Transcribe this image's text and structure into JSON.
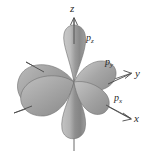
{
  "figure": {
    "kind": "atomic-orbital-diagram",
    "title": "",
    "background_color": "#ffffff"
  },
  "axes": [
    {
      "key": "z",
      "label": "z",
      "direction": "up",
      "arrow": true
    },
    {
      "key": "y",
      "label": "y",
      "direction": "upper-right",
      "arrow": true
    },
    {
      "key": "x",
      "label": "x",
      "direction": "lower-right",
      "arrow": true
    }
  ],
  "orbitals": [
    {
      "key": "pz",
      "p": "p",
      "sub": "z",
      "axis": "z",
      "lobes": 2
    },
    {
      "key": "py",
      "p": "p",
      "sub": "y",
      "axis": "y",
      "lobes": 2
    },
    {
      "key": "px",
      "p": "p",
      "sub": "x",
      "axis": "x",
      "lobes": 2
    }
  ],
  "labels": {
    "axis_z": "z",
    "axis_y": "y",
    "axis_x": "x",
    "pz_p": "p",
    "pz_sub": "z",
    "py_p": "p",
    "py_sub": "y",
    "px_p": "p",
    "px_sub": "x"
  },
  "colors": {
    "lobe_light": "#d3d3d3",
    "lobe_mid": "#a8a8a8",
    "lobe_dark": "#787878",
    "lobe_edge": "#6f6f6f",
    "axis_line": "#555555",
    "text": "#2b2b2b",
    "background": "#ffffff"
  }
}
